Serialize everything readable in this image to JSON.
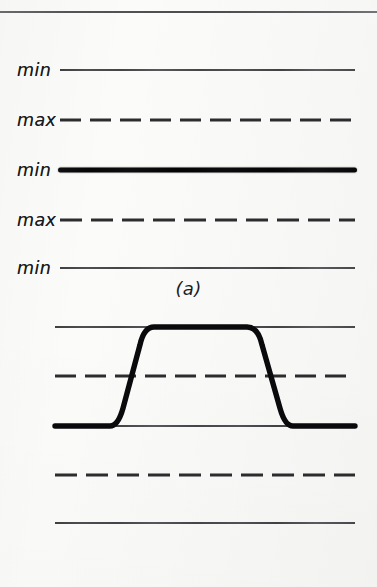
{
  "figure": {
    "background_color": "#fbfbfa",
    "ink_color": "#141416",
    "top_rule": true
  },
  "panels": [
    {
      "id": "a",
      "caption": "(a)",
      "description": "Five horizontal reference traces labelled min and max, no signal transition",
      "line_start_x": 60,
      "line_end_x": 355,
      "traces": [
        {
          "label": "min",
          "style": "solid",
          "y": 52,
          "weight": "thin"
        },
        {
          "label": "max",
          "style": "dashed",
          "y": 102,
          "weight": "thin"
        },
        {
          "label": "min",
          "style": "solid",
          "y": 152,
          "weight": "bold"
        },
        {
          "label": "max",
          "style": "dashed",
          "y": 202,
          "weight": "thin"
        },
        {
          "label": "min",
          "style": "solid",
          "y": 250,
          "weight": "thin"
        }
      ]
    },
    {
      "id": "b",
      "caption": "(b)",
      "description": "Five horizontal reference traces with a bold trapezoidal pulse rising from the third line to the first line",
      "line_start_x": 55,
      "line_end_x": 355,
      "traces": [
        {
          "label": "",
          "style": "solid",
          "y": 27,
          "weight": "thin"
        },
        {
          "label": "",
          "style": "dashed",
          "y": 76,
          "weight": "thin"
        },
        {
          "label": "",
          "style": "solid",
          "y": 126,
          "weight": "thin"
        },
        {
          "label": "",
          "style": "dashed",
          "y": 175,
          "weight": "thin"
        },
        {
          "label": "",
          "style": "solid",
          "y": 223,
          "weight": "thin"
        }
      ],
      "waveform": {
        "name": "trapezoidal-pulse",
        "stroke_width": 5,
        "baseline_y": 126,
        "top_y": 27,
        "start_x": 55,
        "rise_start_x": 112,
        "rise_end_x": 150,
        "fall_start_x": 250,
        "fall_end_x": 290,
        "end_x": 355
      }
    }
  ],
  "chart_data": {
    "type": "line",
    "title": "",
    "xlabel": "",
    "ylabel": "",
    "grid": true,
    "legend_position": "none",
    "subplots": [
      {
        "id": "a",
        "caption": "(a)",
        "reference_levels": [
          {
            "name": "min",
            "y_px": 52,
            "linestyle": "solid",
            "linewidth": "thin"
          },
          {
            "name": "max",
            "y_px": 102,
            "linestyle": "dashed",
            "linewidth": "thin"
          },
          {
            "name": "min",
            "y_px": 152,
            "linestyle": "solid",
            "linewidth": "bold"
          },
          {
            "name": "max",
            "y_px": 202,
            "linestyle": "dashed",
            "linewidth": "thin"
          },
          {
            "name": "min",
            "y_px": 250,
            "linestyle": "solid",
            "linewidth": "thin"
          }
        ],
        "series": [
          {
            "name": "signal",
            "x": [
              60,
              355
            ],
            "y": [
              152,
              152
            ],
            "note": "flat trace coincident with the bold min level"
          }
        ]
      },
      {
        "id": "b",
        "caption": "(b)",
        "reference_levels": [
          {
            "name": "",
            "y_px": 327,
            "linestyle": "solid",
            "linewidth": "thin"
          },
          {
            "name": "",
            "y_px": 376,
            "linestyle": "dashed",
            "linewidth": "thin"
          },
          {
            "name": "",
            "y_px": 426,
            "linestyle": "solid",
            "linewidth": "thin"
          },
          {
            "name": "",
            "y_px": 475,
            "linestyle": "dashed",
            "linewidth": "thin"
          },
          {
            "name": "",
            "y_px": 523,
            "linestyle": "solid",
            "linewidth": "thin"
          }
        ],
        "series": [
          {
            "name": "pulse",
            "x": [
              55,
              112,
              150,
              250,
              290,
              355
            ],
            "y": [
              426,
              426,
              327,
              327,
              426,
              426
            ],
            "note": "bold trapezoidal pulse, rounded corners"
          }
        ]
      }
    ]
  }
}
